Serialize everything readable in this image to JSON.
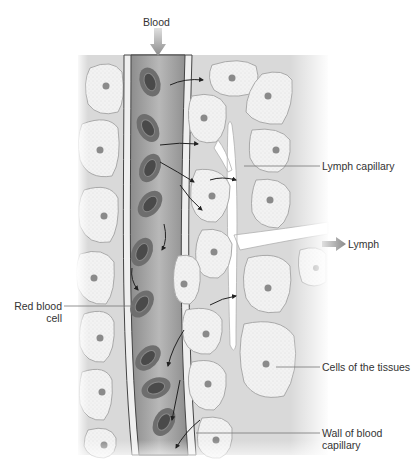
{
  "figure": {
    "labels": {
      "blood": "Blood",
      "lymph_capillary": "Lymph capillary",
      "lymph": "Lymph",
      "red_blood_cell_line1": "Red blood",
      "red_blood_cell_line2": "cell",
      "cells_of_tissues": "Cells of the tissues",
      "wall_line1": "Wall of blood",
      "wall_line2": "capillary"
    },
    "colors": {
      "background": "#ffffff",
      "tissue_fluid": "#d9d9d9",
      "tissue_cell": "#f1f1f1",
      "cell_outline": "#a9a9a9",
      "nucleus": "#8a8a8a",
      "vessel_lumen": "#9f9f9f",
      "vessel_wall": "#efefef",
      "rbc_outer": "#6e6e6e",
      "rbc_inner": "#4a4a4a",
      "arrow": "#222222",
      "label_text": "#333333",
      "leader_line": "#777777"
    }
  }
}
